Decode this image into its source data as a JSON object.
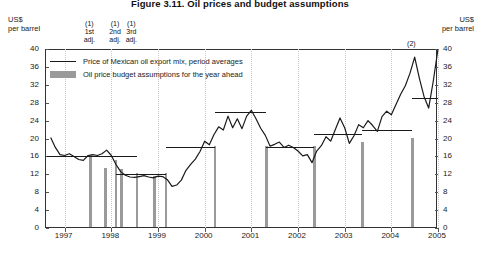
{
  "title": "Figure 3.11. Oil prices and budget assumptions",
  "axis_unit_left": {
    "l1": "US$",
    "l2": "per barrel"
  },
  "axis_unit_right": {
    "l1": "US$",
    "l2": "per barrel"
  },
  "legend": {
    "line_label": "Price of Mexican oil export mix, period averages",
    "bar_label": "Oil price budget assumptions for the year ahead"
  },
  "annotations": [
    {
      "id": "a1",
      "ref": "(1)",
      "l1": "1st",
      "l2": "adj."
    },
    {
      "id": "a2",
      "ref": "(1)",
      "l1": "2nd",
      "l2": "adj."
    },
    {
      "id": "a3",
      "ref": "(1)",
      "l1": "3rd",
      "l2": "adj."
    },
    {
      "id": "a4",
      "ref": "(2)",
      "l1": "",
      "l2": ""
    }
  ],
  "chart_data": {
    "type": "line",
    "title": "Figure 3.11. Oil prices and budget assumptions",
    "xlabel": "",
    "ylabel": "US$ per barrel",
    "ylim": [
      0,
      40
    ],
    "yticks": [
      0,
      4,
      8,
      12,
      16,
      20,
      24,
      28,
      32,
      36,
      40
    ],
    "xlim": [
      1996.6,
      2005.0
    ],
    "xticks": [
      1997,
      1998,
      1999,
      2000,
      2001,
      2002,
      2003,
      2004,
      2005
    ],
    "grid": "vertical-dotted-at-year-ticks",
    "legend_position": "top-left-inside",
    "series": [
      {
        "name": "Price of Mexican oil export mix, period averages",
        "style": "line",
        "color": "#1a1a1a",
        "x": [
          1996.7,
          1996.8,
          1996.9,
          1997.0,
          1997.1,
          1997.2,
          1997.3,
          1997.4,
          1997.5,
          1997.6,
          1997.7,
          1997.8,
          1997.9,
          1998.0,
          1998.1,
          1998.2,
          1998.3,
          1998.4,
          1998.5,
          1998.6,
          1998.7,
          1998.8,
          1998.9,
          1999.0,
          1999.1,
          1999.2,
          1999.3,
          1999.4,
          1999.5,
          1999.6,
          1999.7,
          1999.8,
          1999.9,
          2000.0,
          2000.1,
          2000.2,
          2000.3,
          2000.4,
          2000.5,
          2000.6,
          2000.7,
          2000.8,
          2000.9,
          2001.0,
          2001.1,
          2001.2,
          2001.3,
          2001.4,
          2001.5,
          2001.6,
          2001.7,
          2001.8,
          2001.9,
          2002.0,
          2002.1,
          2002.2,
          2002.3,
          2002.4,
          2002.5,
          2002.6,
          2002.7,
          2002.8,
          2002.9,
          2003.0,
          2003.1,
          2003.2,
          2003.3,
          2003.4,
          2003.5,
          2003.6,
          2003.7,
          2003.8,
          2003.9,
          2004.0,
          2004.1,
          2004.2,
          2004.3,
          2004.4,
          2004.5,
          2004.6,
          2004.7,
          2004.8,
          2004.9,
          2005.0
        ],
        "y": [
          20.2,
          18.0,
          16.4,
          16.2,
          16.6,
          16.0,
          15.3,
          15.1,
          16.2,
          16.4,
          16.2,
          16.6,
          17.4,
          16.2,
          14.2,
          12.6,
          11.8,
          11.4,
          11.3,
          11.5,
          11.7,
          11.4,
          11.2,
          11.6,
          11.5,
          10.8,
          9.3,
          9.6,
          10.7,
          12.9,
          14.2,
          15.4,
          17.1,
          19.4,
          18.6,
          20.9,
          22.6,
          21.9,
          25.0,
          22.4,
          24.4,
          22.2,
          25.0,
          26.3,
          24.4,
          22.3,
          20.7,
          18.3,
          18.7,
          19.2,
          18.0,
          18.5,
          18.0,
          17.2,
          16.1,
          16.4,
          14.6,
          17.2,
          18.4,
          20.4,
          19.4,
          22.0,
          24.6,
          22.4,
          18.9,
          20.6,
          23.1,
          22.4,
          24.0,
          22.9,
          21.6,
          24.9,
          26.1,
          25.3,
          27.6,
          29.9,
          31.8,
          34.6,
          38.2,
          33.5,
          29.4,
          26.8,
          32.9,
          40.0
        ]
      },
      {
        "name": "Oil price budget assumptions for the year ahead",
        "style": "step-segments-with-markers",
        "color": "#1a1a1a",
        "marker_color": "#9a9a9a",
        "segments": [
          {
            "x0": 1996.62,
            "x1": 1997.55,
            "value": 16.0
          },
          {
            "x0": 1997.55,
            "x1": 1998.55,
            "value": 16.0
          },
          {
            "x0": 1998.1,
            "x1": 1999.17,
            "value": 12.0
          },
          {
            "x0": 1999.17,
            "x1": 2000.22,
            "value": 18.0
          },
          {
            "x0": 2000.22,
            "x1": 2001.32,
            "value": 26.0
          },
          {
            "x0": 2001.32,
            "x1": 2002.35,
            "value": 18.0
          },
          {
            "x0": 2002.35,
            "x1": 2003.38,
            "value": 21.0
          },
          {
            "x0": 2003.38,
            "x1": 2004.45,
            "value": 22.0
          },
          {
            "x0": 2004.45,
            "x1": 2005.0,
            "value": 29.0
          }
        ],
        "bars": [
          {
            "x": 1997.55,
            "value": 16.0,
            "note": "1st adj."
          },
          {
            "x": 1997.88,
            "value": 13.2,
            "note": ""
          },
          {
            "x": 1998.1,
            "value": 15.0,
            "note": "2nd adj."
          },
          {
            "x": 1998.22,
            "value": 13.0,
            "note": "3rd adj."
          },
          {
            "x": 1998.55,
            "value": 12.0,
            "note": ""
          },
          {
            "x": 1998.92,
            "value": 11.5,
            "note": ""
          },
          {
            "x": 1999.17,
            "value": 12.0,
            "note": ""
          },
          {
            "x": 2000.22,
            "value": 18.0,
            "note": ""
          },
          {
            "x": 2001.32,
            "value": 18.0,
            "note": ""
          },
          {
            "x": 2002.35,
            "value": 18.0,
            "note": ""
          },
          {
            "x": 2003.38,
            "value": 19.0,
            "note": ""
          },
          {
            "x": 2004.45,
            "value": 20.0,
            "note": ""
          }
        ]
      }
    ]
  }
}
